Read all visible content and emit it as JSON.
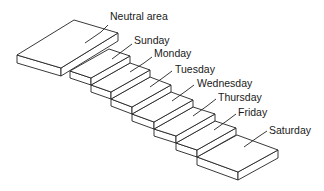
{
  "diagram": {
    "type": "isometric staircase",
    "steps": [
      {
        "label": "Neutral area"
      },
      {
        "label": "Sunday"
      },
      {
        "label": "Monday"
      },
      {
        "label": "Tuesday"
      },
      {
        "label": "Wednesday"
      },
      {
        "label": "Thursday"
      },
      {
        "label": "Friday"
      },
      {
        "label": "Saturday"
      }
    ]
  }
}
